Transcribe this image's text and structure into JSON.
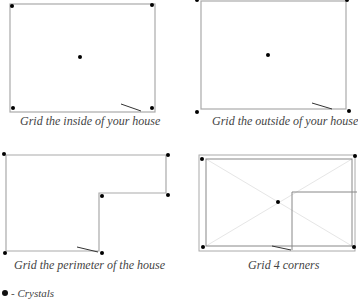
{
  "panels": [
    {
      "id": "inside",
      "caption": "Grid the inside of your house"
    },
    {
      "id": "outside",
      "caption": "Grid the outside of your house"
    },
    {
      "id": "perimeter",
      "caption": "Grid the perimeter of the house"
    },
    {
      "id": "corners",
      "caption": "Grid 4 corners"
    }
  ],
  "legend": {
    "symbol": "crystal-dot",
    "label": "- Crystals"
  },
  "colors": {
    "outline": "#aaaaaa",
    "outline_dark": "#888888",
    "diagonal": "#e6e6e6",
    "crystal": "#111111",
    "door": "#333333"
  }
}
